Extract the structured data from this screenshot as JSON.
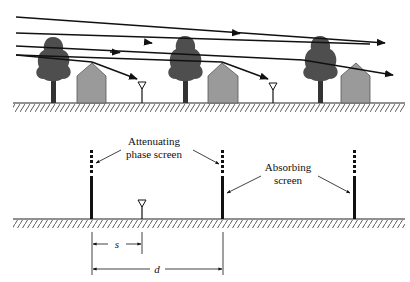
{
  "top_scene": {
    "description": "Rays propagating over rows of trees and houses to receiver antennas",
    "rows": 3,
    "elements_per_row": [
      "tree",
      "house",
      "antenna"
    ]
  },
  "bottom_model": {
    "labels": {
      "attenuating": [
        "Attenuating",
        "phase screen"
      ],
      "absorbing": [
        "Absorbing",
        "screen"
      ]
    },
    "dimensions": {
      "s": "s",
      "d": "d"
    },
    "screens": 3
  },
  "colors": {
    "line": "#111111",
    "tree": "#4a4a4a",
    "house": "#9a9a9a",
    "ground": "#222222"
  }
}
